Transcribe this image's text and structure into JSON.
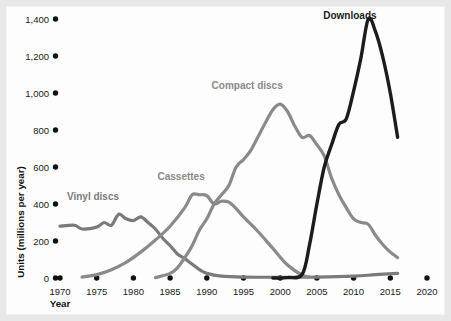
{
  "chart_data": {
    "type": "line",
    "title": "",
    "xlabel": "Year",
    "ylabel": "Units (millions per year)",
    "xlim": [
      1970,
      2020
    ],
    "ylim": [
      0,
      1400
    ],
    "grid": false,
    "legend_position": "inline-labels",
    "xticks": [
      "1970",
      "1975",
      "1980",
      "1985",
      "1990",
      "1995",
      "2000",
      "2005",
      "2010",
      "2015",
      "2020"
    ],
    "yticks": [
      "0",
      "200",
      "400",
      "600",
      "800",
      "1,000",
      "1,200",
      "1,400"
    ],
    "series": [
      {
        "name": "Vinyl discs",
        "color": "#7a7a7a",
        "label_x": 1974.5,
        "label_y": 420,
        "x": [
          1970,
          1972,
          1973,
          1975,
          1976,
          1977,
          1978,
          1979,
          1980,
          1981,
          1982,
          1983,
          1984,
          1985,
          1986,
          1987,
          1988,
          1989,
          1990,
          1992,
          1995,
          2000,
          2005,
          2010,
          2013,
          2016
        ],
        "values": [
          280,
          285,
          265,
          275,
          300,
          285,
          345,
          320,
          310,
          330,
          300,
          265,
          215,
          175,
          130,
          105,
          75,
          45,
          25,
          10,
          5,
          4,
          5,
          10,
          18,
          25
        ]
      },
      {
        "name": "Cassettes",
        "color": "#8a8a8a",
        "label_x": 1986.5,
        "label_y": 530,
        "x": [
          1973,
          1975,
          1977,
          1979,
          1981,
          1983,
          1985,
          1987,
          1988,
          1989,
          1990,
          1991,
          1992,
          1993,
          1994,
          1995,
          1997,
          1999,
          2001,
          2003,
          2004
        ],
        "values": [
          5,
          18,
          45,
          85,
          140,
          205,
          280,
          380,
          450,
          450,
          445,
          400,
          415,
          410,
          375,
          330,
          250,
          160,
          70,
          15,
          5
        ]
      },
      {
        "name": "Compact discs",
        "color": "#8a8a8a",
        "label_x": 1995.5,
        "label_y": 1020,
        "x": [
          1983,
          1985,
          1986,
          1987,
          1988,
          1989,
          1990,
          1991,
          1992,
          1993,
          1994,
          1995,
          1996,
          1997,
          1998,
          1999,
          2000,
          2001,
          2002,
          2003,
          2004,
          2005,
          2006,
          2007,
          2008,
          2009,
          2010,
          2011,
          2012,
          2013,
          2014,
          2015,
          2016
        ],
        "values": [
          2,
          25,
          55,
          110,
          175,
          260,
          320,
          400,
          450,
          500,
          600,
          640,
          690,
          765,
          840,
          910,
          940,
          900,
          820,
          760,
          770,
          720,
          660,
          540,
          450,
          380,
          320,
          300,
          290,
          230,
          180,
          140,
          110
        ]
      },
      {
        "name": "Downloads",
        "color": "#1c1c1c",
        "label_x": 2009.5,
        "label_y": 1400,
        "x": [
          1999,
          2001,
          2003,
          2004,
          2005,
          2006,
          2007,
          2008,
          2009,
          2010,
          2011,
          2012,
          2013,
          2014,
          2015,
          2016
        ],
        "values": [
          0,
          2,
          20,
          180,
          400,
          600,
          720,
          830,
          860,
          1010,
          1190,
          1400,
          1330,
          1190,
          1000,
          760
        ]
      }
    ]
  }
}
